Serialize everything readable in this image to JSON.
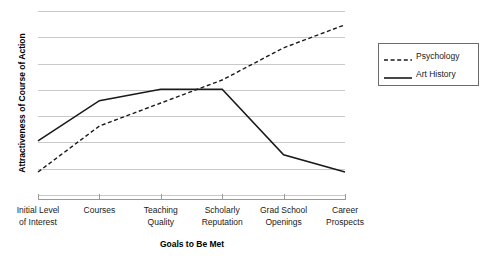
{
  "chart_data": {
    "type": "line",
    "title": "",
    "xlabel": "Goals to Be Met",
    "ylabel": "Attractiveness of Course of Action",
    "categories": [
      "Initial Level\nof Interest",
      "Courses",
      "Teaching\nQuality",
      "Scholarly\nReputation",
      "Grad School\nOpenings",
      "Career\nProspects"
    ],
    "categories_flat": [
      "Initial Level of Interest",
      "Courses",
      "Teaching Quality",
      "Scholarly Reputation",
      "Grad School Openings",
      "Career Prospects"
    ],
    "series": [
      {
        "name": "Psychology",
        "style": "dashed",
        "color": "#1a1a1a",
        "values": [
          1,
          3,
          4,
          5,
          6.4,
          7.4
        ]
      },
      {
        "name": "Art History",
        "style": "solid",
        "color": "#1a1a1a",
        "values": [
          2.35,
          4.1,
          4.6,
          4.6,
          1.75,
          1
        ]
      }
    ],
    "ylim": [
      0,
      8
    ],
    "yticks_count": 8,
    "y_tick_labels": [],
    "grid": true,
    "legend_position": "right"
  },
  "legend": {
    "entries": [
      {
        "label": "Psychology",
        "style": "dashed"
      },
      {
        "label": "Art History",
        "style": "solid"
      }
    ]
  },
  "colors": {
    "grid": "#c9c9c9",
    "axis": "#9a9a9a",
    "line": "#1a1a1a",
    "legend_border": "#6b6b6b",
    "background": "#ffffff"
  }
}
